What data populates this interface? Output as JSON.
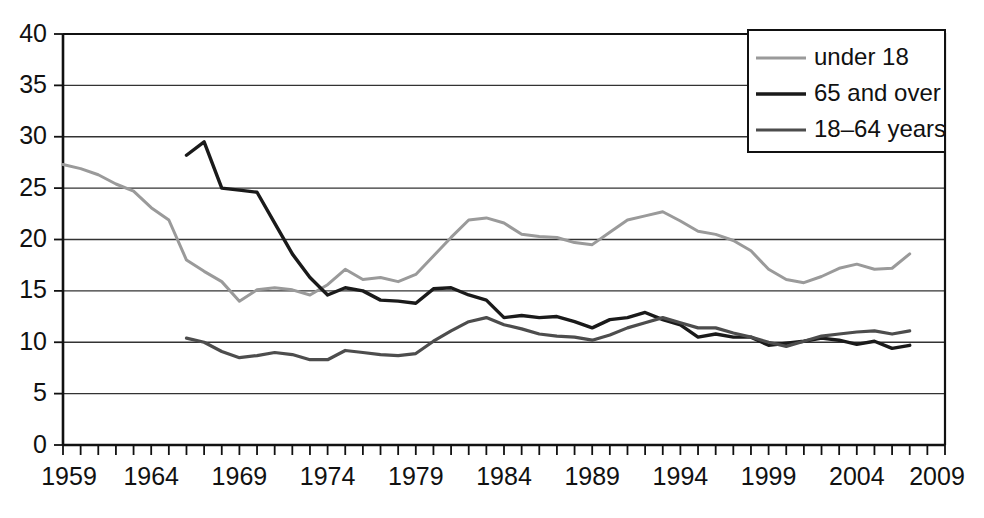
{
  "chart_data": {
    "type": "line",
    "title": "",
    "subtitle": "",
    "xlabel": "",
    "ylabel": "",
    "xlim": [
      1959,
      2009
    ],
    "ylim": [
      0,
      40
    ],
    "grid": true,
    "grid_axis": "y",
    "legend_position": "top-right",
    "x_tick_labels": [
      "1959",
      "1964",
      "1969",
      "1974",
      "1979",
      "1984",
      "1989",
      "1994",
      "1999",
      "2004",
      "2009"
    ],
    "x_tick_values": [
      1959,
      1964,
      1969,
      1974,
      1979,
      1984,
      1989,
      1994,
      1999,
      2004,
      2009
    ],
    "x_minor_tick_step": 1,
    "y_tick_labels": [
      "0",
      "5",
      "10",
      "15",
      "20",
      "25",
      "30",
      "35",
      "40"
    ],
    "y_tick_values": [
      0,
      5,
      10,
      15,
      20,
      25,
      30,
      35,
      40
    ],
    "series": [
      {
        "name": "under 18",
        "color": "#9a9a9a",
        "stroke_width": 3.0,
        "x": [
          1959,
          1960,
          1961,
          1962,
          1963,
          1964,
          1965,
          1966,
          1967,
          1968,
          1969,
          1970,
          1971,
          1972,
          1973,
          1974,
          1975,
          1976,
          1977,
          1978,
          1979,
          1980,
          1981,
          1982,
          1983,
          1984,
          1985,
          1986,
          1987,
          1988,
          1989,
          1990,
          1991,
          1992,
          1993,
          1994,
          1995,
          1996,
          1997,
          1998,
          1999,
          2000,
          2001,
          2002,
          2003,
          2004,
          2005,
          2006,
          2007
        ],
        "y": [
          27.3,
          26.9,
          26.3,
          25.4,
          24.7,
          23.1,
          21.9,
          18.0,
          16.9,
          15.9,
          14.0,
          15.1,
          15.3,
          15.1,
          14.6,
          15.6,
          17.1,
          16.1,
          16.3,
          15.9,
          16.6,
          18.4,
          20.2,
          21.9,
          22.1,
          21.6,
          20.5,
          20.3,
          20.2,
          19.7,
          19.5,
          20.7,
          21.9,
          22.3,
          22.7,
          21.8,
          20.8,
          20.5,
          19.9,
          18.9,
          17.1,
          16.1,
          15.8,
          16.4,
          17.2,
          17.6,
          17.1,
          17.2,
          18.6
        ]
      },
      {
        "name": "65 and over",
        "color": "#1a1a1a",
        "stroke_width": 3.4,
        "x": [
          1966,
          1967,
          1968,
          1969,
          1970,
          1971,
          1972,
          1973,
          1974,
          1975,
          1976,
          1977,
          1978,
          1979,
          1980,
          1981,
          1982,
          1983,
          1984,
          1985,
          1986,
          1987,
          1988,
          1989,
          1990,
          1991,
          1992,
          1993,
          1994,
          1995,
          1996,
          1997,
          1998,
          1999,
          2000,
          2001,
          2002,
          2003,
          2004,
          2005,
          2006,
          2007
        ],
        "y": [
          28.2,
          29.5,
          25.0,
          24.8,
          24.6,
          21.6,
          18.6,
          16.3,
          14.6,
          15.3,
          15.0,
          14.1,
          14.0,
          13.8,
          15.2,
          15.3,
          14.6,
          14.1,
          12.4,
          12.6,
          12.4,
          12.5,
          12.0,
          11.4,
          12.2,
          12.4,
          12.9,
          12.2,
          11.7,
          10.5,
          10.8,
          10.5,
          10.5,
          9.7,
          9.9,
          10.1,
          10.4,
          10.2,
          9.8,
          10.1,
          9.4,
          9.7
        ]
      },
      {
        "name": "18–64 years",
        "color": "#4d4d4d",
        "stroke_width": 3.2,
        "x": [
          1966,
          1967,
          1968,
          1969,
          1970,
          1971,
          1972,
          1973,
          1974,
          1975,
          1976,
          1977,
          1978,
          1979,
          1980,
          1981,
          1982,
          1983,
          1984,
          1985,
          1986,
          1987,
          1988,
          1989,
          1990,
          1991,
          1992,
          1993,
          1994,
          1995,
          1996,
          1997,
          1998,
          1999,
          2000,
          2001,
          2002,
          2003,
          2004,
          2005,
          2006,
          2007
        ],
        "y": [
          10.4,
          10.0,
          9.1,
          8.5,
          8.7,
          9.0,
          8.8,
          8.3,
          8.3,
          9.2,
          9.0,
          8.8,
          8.7,
          8.9,
          10.1,
          11.1,
          12.0,
          12.4,
          11.7,
          11.3,
          10.8,
          10.6,
          10.5,
          10.2,
          10.7,
          11.4,
          11.9,
          12.4,
          11.9,
          11.4,
          11.4,
          10.9,
          10.5,
          10.0,
          9.6,
          10.1,
          10.6,
          10.8,
          11.0,
          11.1,
          10.8,
          11.1
        ]
      }
    ]
  },
  "legend": {
    "entries": [
      {
        "label": "under 18"
      },
      {
        "label": "65 and over"
      },
      {
        "label": "18–64 years"
      }
    ]
  }
}
